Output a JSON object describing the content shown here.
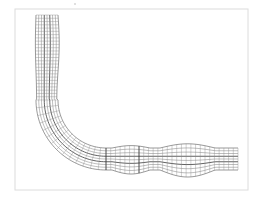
{
  "diagram": {
    "type": "structured-mesh",
    "colors": {
      "background": "#ffffff",
      "frame": "#dcdcdc",
      "mesh": "#6e6e6e",
      "mesh_major": "#3a3a3a"
    },
    "frame": {
      "x": 15,
      "y": 9,
      "width": 233,
      "height": 181
    },
    "top_dot": {
      "x": 75,
      "y": 4
    },
    "pipe": {
      "vertical_leg": {
        "x_left": 36,
        "x_right": 58,
        "y_top": 15,
        "y_bend_start": 100
      },
      "bend": {
        "center_x": 106,
        "center_y": 100,
        "inner_radius": 48,
        "outer_radius": 70
      },
      "horizontal_leg": {
        "y_top": 148,
        "y_bottom": 170,
        "x_start": 106,
        "x_end": 238
      },
      "bulges": [
        {
          "x_start": 112,
          "x_end": 150,
          "amount": 4
        },
        {
          "x_start": 160,
          "x_end": 215,
          "amount": 7
        }
      ],
      "radial_divisions": 8,
      "major_radial_indices": [
        3,
        5
      ],
      "vertical_cross_sections": 26,
      "bend_cross_sections": 14,
      "horizontal_cross_sections": 28,
      "major_cross_sections": [
        {
          "segment": "horizontal",
          "index": 0
        },
        {
          "segment": "horizontal",
          "index": 7
        }
      ]
    }
  }
}
